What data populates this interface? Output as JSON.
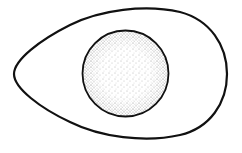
{
  "figure": {
    "alt": "Line drawing of an egg with a stippled yolk",
    "parts": [
      {
        "name": "egg-white-outline",
        "shape": "egg",
        "stroke": "#111111",
        "fill": "#ffffff"
      },
      {
        "name": "yolk",
        "shape": "circle",
        "stroke": "#111111",
        "fill": "stippled",
        "dot_color": "#333333"
      }
    ]
  }
}
